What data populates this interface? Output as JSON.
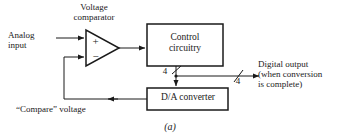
{
  "figure": {
    "caption": "(a)",
    "background_color": "#ffffff",
    "line_color": "#1a1a1a",
    "width": 340,
    "height": 140
  },
  "labels": {
    "voltage_comparator": "Voltage\ncomparator",
    "analog_input": "Analog\ninput",
    "control_circuitry": "Control\ncircuitry",
    "da_converter": "D/A converter",
    "digital_output": "Digital output\n(when conversion\nis complete)",
    "compare_voltage": "“Compare” voltage",
    "comparator_plus": "+",
    "comparator_minus": "−",
    "bus_width_dac": "4",
    "bus_width_output": "4"
  },
  "blocks": [
    {
      "id": "control-circuitry",
      "label": "Control circuitry",
      "shape": "rectangle"
    },
    {
      "id": "da-converter",
      "label": "D/A converter",
      "shape": "rectangle"
    },
    {
      "id": "voltage-comparator",
      "label": "Voltage comparator",
      "shape": "triangle"
    }
  ],
  "connections": [
    {
      "id": "analog-input-to-comparator",
      "from": "analog input",
      "to": "comparator + input",
      "arrow": true
    },
    {
      "id": "comparator-to-control",
      "from": "comparator output",
      "to": "control circuitry",
      "arrow": true
    },
    {
      "id": "control-to-dac",
      "from": "control circuitry",
      "to": "D/A converter",
      "arrow": true,
      "bus_width": "4"
    },
    {
      "id": "control-to-digital-output",
      "from": "control circuitry",
      "to": "digital output",
      "arrow": true,
      "bus_width": "4"
    },
    {
      "id": "dac-to-comparator",
      "from": "D/A converter",
      "to": "comparator − input",
      "arrow": true,
      "signal": "“Compare” voltage"
    }
  ]
}
